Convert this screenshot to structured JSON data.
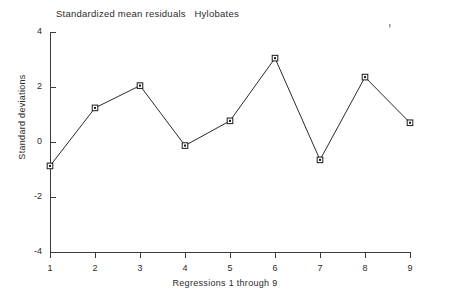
{
  "chart_data": {
    "type": "line",
    "title": "Standardized mean residuals   Hylobates",
    "xlabel": "Regressions 1 through 9",
    "ylabel": "Standard deviations",
    "categories": [
      1,
      2,
      3,
      4,
      5,
      6,
      7,
      8,
      9
    ],
    "x": [
      1,
      2,
      3,
      4,
      5,
      6,
      7,
      8,
      9
    ],
    "values": [
      -0.87,
      1.24,
      2.05,
      -0.13,
      0.77,
      3.05,
      -0.65,
      2.36,
      0.7
    ],
    "series": [
      {
        "name": "Standardized mean residuals",
        "values": [
          -0.87,
          1.24,
          2.05,
          -0.13,
          0.77,
          3.05,
          -0.65,
          2.36,
          0.7
        ]
      }
    ],
    "xlim": [
      1,
      9
    ],
    "ylim": [
      -4,
      4
    ],
    "xticks": [
      "1",
      "2",
      "3",
      "4",
      "5",
      "6",
      "7",
      "8",
      "9"
    ],
    "yticks": [
      "4",
      "2",
      "0",
      "-2",
      "-4"
    ],
    "ytick_values": [
      4,
      2,
      0,
      -2,
      -4
    ],
    "grid": false,
    "legend": false,
    "legend_position": "none",
    "marker": "square-open-with-dot",
    "line_color": "#2a2a2a",
    "marker_color": "#1a1a1a",
    "background_color": "#ffffff"
  },
  "figure": {
    "title": "Standardized mean residuals   Hylobates",
    "x_axis_title": "Regressions 1 through 9",
    "y_axis_title": "Standard deviations",
    "y_tick_labels": [
      "4",
      "2",
      "0",
      "-2",
      "-4"
    ],
    "x_tick_labels": [
      "1",
      "2",
      "3",
      "4",
      "5",
      "6",
      "7",
      "8",
      "9"
    ]
  }
}
